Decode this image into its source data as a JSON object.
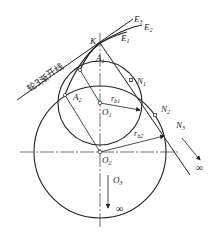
{
  "diagram": {
    "type": "gear involute geometry",
    "points": {
      "K": {
        "label": "K",
        "x": 100,
        "y": 43
      },
      "A1": {
        "label": "A",
        "sub": "1",
        "x": 80,
        "y": 70
      },
      "A2": {
        "label": "A",
        "sub": "2",
        "x": 65,
        "y": 95
      },
      "O1": {
        "label": "O",
        "sub": "1",
        "x": 100,
        "y": 103
      },
      "O2": {
        "label": "O",
        "sub": "2",
        "x": 100,
        "y": 152
      },
      "N1": {
        "label": "N",
        "sub": "1",
        "x": 131,
        "y": 80
      },
      "N2": {
        "label": "N",
        "sub": "2",
        "x": 155,
        "y": 115
      },
      "N3": {
        "label": "N",
        "sub": "3"
      },
      "O3": {
        "label": "O",
        "sub": "3"
      }
    },
    "labels": {
      "E": "E",
      "E_sub": "3",
      "E2": "E",
      "E2_sub": "2",
      "E1": "E",
      "E1_sub": "1",
      "K": "K",
      "A1": "A",
      "A1_sub": "1",
      "A2": "A",
      "A2_sub": "2",
      "O1": "O",
      "O1_sub": "1",
      "O2": "O",
      "O2_sub": "2",
      "O3": "O",
      "O3_sub": "3",
      "N1": "N",
      "N1_sub": "1",
      "N2": "N",
      "N2_sub": "2",
      "N3": "N",
      "N3_sub": "3",
      "rb1": "r",
      "rb1_sub": "b1",
      "rb2": "r",
      "rb2_sub": "b2",
      "infinity_right": "∞",
      "infinity_bottom": "∞",
      "involute_line": "轮3渐开线"
    },
    "circles": [
      {
        "name": "base-circle-1",
        "cx": 100,
        "cy": 103,
        "r": 42
      },
      {
        "name": "base-circle-2",
        "cx": 100,
        "cy": 152,
        "r": 66
      }
    ],
    "colors": {
      "stroke": "#222222",
      "background": "#ffffff"
    }
  }
}
